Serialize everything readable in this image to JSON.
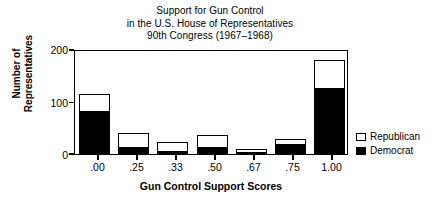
{
  "chart_data": {
    "type": "bar",
    "title_lines": [
      "Support for Gun Control",
      "in the U.S. House of Representatives",
      "90th Congress (1967–1968)"
    ],
    "subtitle": "",
    "stacked": true,
    "xlabel": "Gun Control Support Scores",
    "ylabel": "Number of Representatives",
    "ylabel_lines": [
      "Number of",
      "Representatives"
    ],
    "categories": [
      ".00",
      ".25",
      ".33",
      ".50",
      ".67",
      ".75",
      "1.00"
    ],
    "series": [
      {
        "name": "Democrat",
        "color": "#000000",
        "values": [
          80,
          12,
          3,
          11,
          2,
          18,
          124
        ]
      },
      {
        "name": "Republican",
        "color": "#ffffff",
        "values": [
          35,
          28,
          20,
          26,
          8,
          11,
          56
        ]
      }
    ],
    "totals": [
      115,
      40,
      23,
      37,
      10,
      29,
      180
    ],
    "ylim": [
      0,
      200
    ],
    "yticks": [
      0,
      100,
      200
    ],
    "ytick_labels": [
      "0",
      "100",
      "200"
    ],
    "grid": false,
    "legend_position": "right",
    "legend": [
      {
        "label": "Republican",
        "swatch": "white"
      },
      {
        "label": "Democrat",
        "swatch": "black"
      }
    ]
  },
  "colors": {
    "axis": "#000000",
    "background": "#ffffff",
    "democrat": "#000000",
    "republican": "#ffffff"
  }
}
